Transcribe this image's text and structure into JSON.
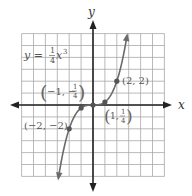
{
  "chart_data": {
    "type": "line",
    "title": "",
    "equation_label": {
      "lhs": "y",
      "eq": "=",
      "num": "1",
      "den": "4",
      "var": "x",
      "exp": "3"
    },
    "xlabel": "x",
    "ylabel": "y",
    "xlim": [
      -6,
      6
    ],
    "ylim": [
      -6,
      6
    ],
    "grid": true,
    "grid_step": 1,
    "function": "y = (1/4) x^3",
    "series": [
      {
        "name": "y = 1/4 x^3",
        "x": [
          -2.9,
          -2.5,
          -2,
          -1.5,
          -1,
          -0.5,
          0,
          0.5,
          1,
          1.5,
          2,
          2.5,
          2.85
        ],
        "y": [
          -6.1,
          -3.91,
          -2,
          -0.84,
          -0.25,
          -0.03,
          0,
          0.03,
          0.25,
          0.84,
          2,
          3.91,
          5.79
        ]
      }
    ],
    "points": [
      {
        "x": 2,
        "y": 2,
        "label_a": "2",
        "label_b": "2"
      },
      {
        "x": 1,
        "y": 0.25,
        "label_a": "1",
        "label_num": "1",
        "label_den": "4"
      },
      {
        "x": 0,
        "y": 0
      },
      {
        "x": -1,
        "y": -0.25,
        "label_a": "−1",
        "label_num": "1",
        "label_den": "4",
        "label_sign": "−"
      },
      {
        "x": -2,
        "y": -2,
        "label_a": "−2",
        "label_b": "−2"
      }
    ],
    "colors": {
      "grid": "#a8a8a8",
      "axes": "#222222",
      "curve": "#6a6a6a",
      "labels": "#555555"
    }
  },
  "labels": {
    "x_axis": "x",
    "y_axis": "y",
    "pt_2_2": "(2, 2)",
    "pt_m2_m2": "(−2, −2)",
    "pt_1_a": "1,",
    "pt_1_num": "1",
    "pt_1_den": "4",
    "pt_m1_a": "−1, −",
    "pt_m1_num": "1",
    "pt_m1_den": "4",
    "eq_lhs": "y =",
    "eq_num": "1",
    "eq_den": "4",
    "eq_var": "x",
    "eq_exp": "3"
  }
}
